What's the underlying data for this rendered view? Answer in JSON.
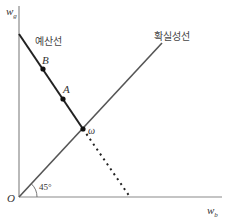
{
  "diagram": {
    "axes": {
      "y_label": "w",
      "y_subscript": "g",
      "x_label": "w",
      "x_subscript": "b",
      "origin_label": "O"
    },
    "lines": {
      "budget_line_label": "예산선",
      "certainty_line_label": "확실성선",
      "angle_label": "45°"
    },
    "points": {
      "B": "B",
      "A": "A",
      "omega": "ω"
    },
    "colors": {
      "axis": "#888888",
      "budget_line": "#222222",
      "certainty_line": "#555555",
      "point": "#111111"
    }
  }
}
